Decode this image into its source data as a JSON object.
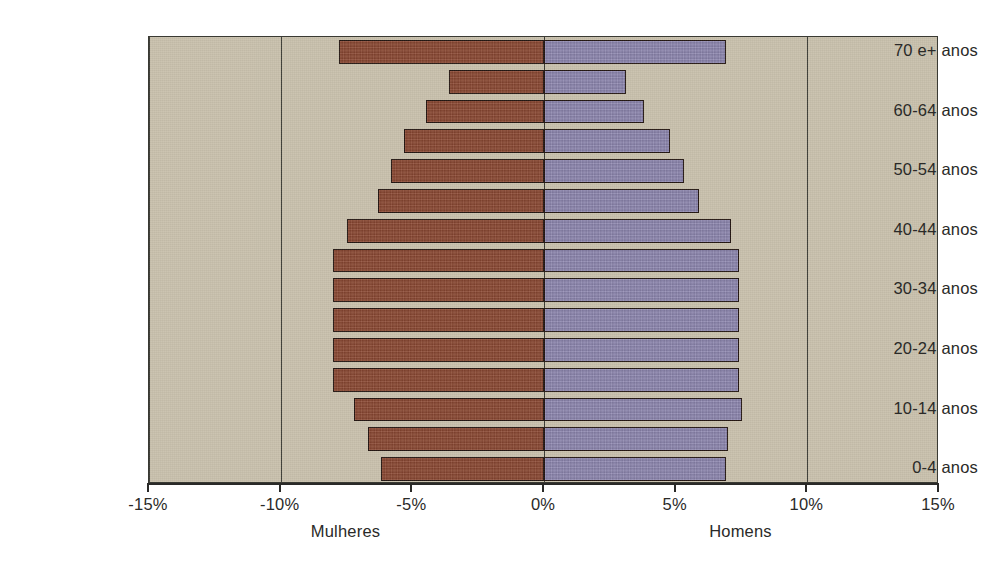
{
  "chart_data": {
    "type": "bar",
    "subtype": "population-pyramid",
    "title": "",
    "xlabel": "",
    "ylabel": "",
    "xlim": [
      -15,
      15
    ],
    "xticks": [
      -15,
      -10,
      -5,
      0,
      5,
      10,
      15
    ],
    "xtick_labels": [
      "-15%",
      "-10%",
      "-5%",
      "0%",
      "5%",
      "10%",
      "15%"
    ],
    "grid": true,
    "gridlines_at": [
      -15,
      -10,
      0,
      10,
      15
    ],
    "legend_position": "below-axis",
    "categories": [
      "0-4 anos",
      "5-9 anos",
      "10-14 anos",
      "15-19 anos",
      "20-24 anos",
      "25-29 anos",
      "30-34 anos",
      "35-39 anos",
      "40-44 anos",
      "45-49 anos",
      "50-54 anos",
      "55-59 anos",
      "60-64 anos",
      "65-69 anos",
      "70 e+ anos"
    ],
    "visible_category_labels": [
      "0-4 anos",
      "10-14 anos",
      "20-24 anos",
      "30-34 anos",
      "40-44 anos",
      "50-54 anos",
      "60-64 anos",
      "70 e+ anos"
    ],
    "series": [
      {
        "name": "Mulheres",
        "side": "left",
        "color": "#8d4a33",
        "values": [
          -6.2,
          -6.7,
          -7.2,
          -8.0,
          -8.0,
          -8.0,
          -8.0,
          -8.0,
          -7.5,
          -6.3,
          -5.8,
          -5.3,
          -4.5,
          -3.6,
          -7.8
        ]
      },
      {
        "name": "Homens",
        "side": "right",
        "color": "#8f88b1",
        "values": [
          6.9,
          7.0,
          7.5,
          7.4,
          7.4,
          7.4,
          7.4,
          7.4,
          7.1,
          5.9,
          5.3,
          4.8,
          3.8,
          3.1,
          6.9
        ]
      }
    ]
  },
  "style": {
    "plot_background": "#c9c1ad",
    "page_background": "#ffffff",
    "bar_outline": "#241712",
    "axis_color": "#2a2a28",
    "female_color": "#8d4a33",
    "male_color": "#8f88b1"
  },
  "axis": {
    "left_caption": "Mulheres",
    "right_caption": "Homens"
  }
}
